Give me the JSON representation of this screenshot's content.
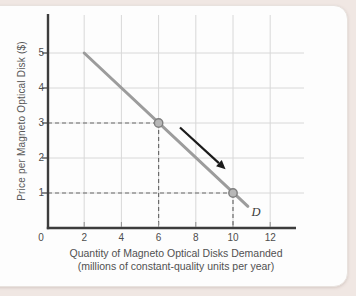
{
  "figure": {
    "background_color": "#f0e7e3",
    "card_color": "#fdfdfd"
  },
  "chart_data": {
    "type": "line",
    "title": "",
    "xlabel": "Quantity of Magneto Optical Disks Demanded",
    "xlabel_sub": "(millions of constant-quality units per year)",
    "ylabel": "Price per Magneto Optical Disk ($)",
    "xlim": [
      0,
      13.4
    ],
    "ylim": [
      0,
      6.1
    ],
    "grid": true,
    "x_ticks": [
      0,
      2,
      4,
      6,
      8,
      10,
      12
    ],
    "y_ticks": [
      1,
      2,
      3,
      4,
      5
    ],
    "series": [
      {
        "name": "D",
        "type": "line",
        "color": "#9c9c9c",
        "points": [
          [
            2,
            5
          ],
          [
            10.8,
            0.62
          ]
        ]
      }
    ],
    "curve_label": {
      "text": "D",
      "x": 11.24,
      "y": 0.43
    },
    "highlight_points": [
      {
        "x": 6,
        "y": 3
      },
      {
        "x": 10,
        "y": 1
      }
    ],
    "dashed_guides": [
      {
        "x": 6,
        "y": 3
      },
      {
        "x": 10,
        "y": 1
      }
    ],
    "movement_arrow": {
      "from": [
        7.15,
        2.87
      ],
      "to": [
        9.6,
        1.68
      ],
      "color": "#1b1b1b"
    },
    "colors": {
      "grid": "#d8d8d8",
      "axis": "#3d3d3d",
      "dashed_guide": "#6b6b6b",
      "point_fill": "#b7b7b7",
      "point_stroke": "#7f7f7f"
    }
  }
}
